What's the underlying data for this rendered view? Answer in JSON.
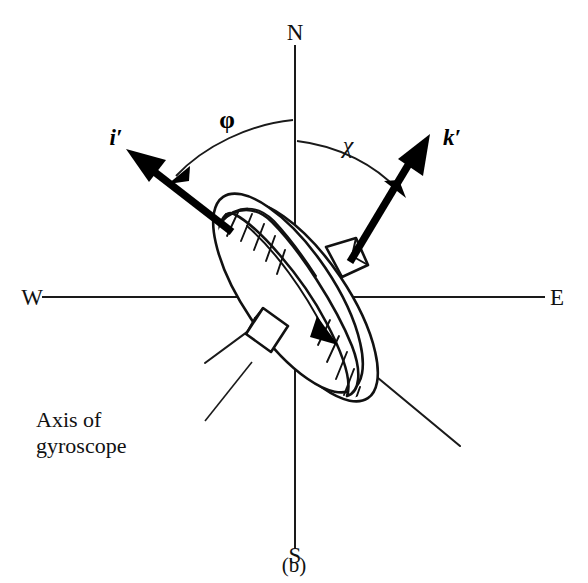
{
  "figure": {
    "caption": "(b)"
  },
  "compass": {
    "north": "N",
    "south": "S",
    "east": "E",
    "west": "W"
  },
  "vectors": [
    {
      "id": "i-prime",
      "label": "i′",
      "description": "unit vector i prime, up and to the left"
    },
    {
      "id": "k-prime",
      "label": "k′",
      "description": "unit vector k prime, up and to the right"
    }
  ],
  "angles": [
    {
      "id": "phi",
      "label": "φ",
      "from": "N axis",
      "to": "i′ vector"
    },
    {
      "id": "chi",
      "label": "χ",
      "from": "N axis",
      "to": "k′ vector"
    }
  ],
  "annotations": [
    {
      "id": "axis-of-gyroscope",
      "line1": "Axis of",
      "line2": "gyroscope"
    }
  ],
  "colors": {
    "ink": "#111111",
    "background": "#ffffff",
    "vector": "#000000"
  }
}
